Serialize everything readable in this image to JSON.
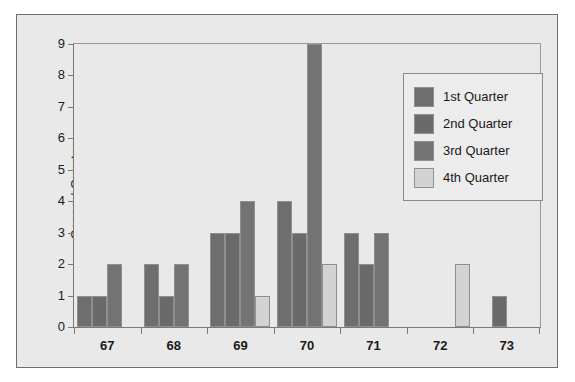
{
  "chart_data": {
    "type": "bar",
    "title": "",
    "xlabel": "",
    "ylabel": "Cases / Quarter",
    "categories": [
      "67",
      "68",
      "69",
      "70",
      "71",
      "72",
      "73"
    ],
    "ylim": [
      0,
      9
    ],
    "yticks": [
      0,
      1,
      2,
      3,
      4,
      5,
      6,
      7,
      8,
      9
    ],
    "ytick_labels": [
      "0",
      "1",
      "2",
      "3",
      "4",
      "5",
      "6",
      "7",
      "8",
      "9"
    ],
    "grid": false,
    "legend_position": "upper right",
    "series": [
      {
        "name": "1st Quarter",
        "color": "#6e6e6e",
        "values": [
          1,
          2,
          3,
          4,
          3,
          0,
          0
        ]
      },
      {
        "name": "2nd Quarter",
        "color": "#6a6a6a",
        "values": [
          1,
          1,
          3,
          3,
          2,
          0,
          1
        ]
      },
      {
        "name": "3rd Quarter",
        "color": "#737373",
        "values": [
          2,
          2,
          4,
          9,
          3,
          0,
          0
        ]
      },
      {
        "name": "4th Quarter",
        "color": "#d3d3d3",
        "values": [
          0,
          0,
          1,
          2,
          0,
          2,
          0
        ]
      }
    ]
  },
  "legend": {
    "items": [
      {
        "label": "1st Quarter"
      },
      {
        "label": "2nd Quarter"
      },
      {
        "label": "3rd Quarter"
      },
      {
        "label": "4th Quarter"
      }
    ]
  },
  "axes": {
    "y_axis_title": "Cases / Quarter"
  }
}
